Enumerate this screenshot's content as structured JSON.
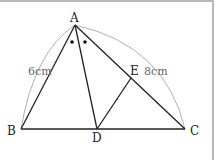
{
  "diagram": {
    "type": "geometry-triangle",
    "points": {
      "A": {
        "label": "A",
        "x": 75,
        "y": 25
      },
      "B": {
        "label": "B",
        "x": 21,
        "y": 129
      },
      "C": {
        "label": "C",
        "x": 185,
        "y": 129
      },
      "D": {
        "label": "D",
        "x": 97,
        "y": 129
      },
      "E": {
        "label": "E",
        "x": 131,
        "y": 78
      }
    },
    "measurements": {
      "AB": "6cm",
      "AC": "8cm"
    },
    "angle_marks": "equal angles BAD and DAC (bisector AD)",
    "colors": {
      "line": "#222222",
      "arc": "#9a9a9a",
      "frame": "#b8b8b8"
    }
  }
}
